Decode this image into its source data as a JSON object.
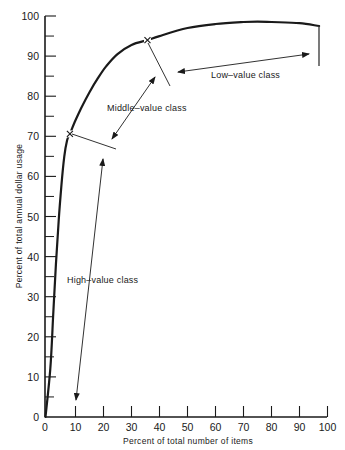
{
  "chart_data": {
    "type": "line",
    "title": "",
    "xlabel": "Percent of total number of items",
    "ylabel": "Percent of total annual dollar usage",
    "xlim": [
      0,
      100
    ],
    "ylim": [
      0,
      100
    ],
    "grid": false,
    "x_ticks": [
      0,
      10,
      20,
      30,
      40,
      50,
      60,
      70,
      80,
      90,
      100
    ],
    "y_ticks": [
      0,
      10,
      20,
      30,
      40,
      50,
      60,
      70,
      80,
      90,
      100
    ],
    "y_minor_ticks": [
      5,
      15,
      25,
      35,
      45,
      55,
      65,
      75,
      85,
      95
    ],
    "series": [
      {
        "name": "ABC cumulative curve",
        "x": [
          0,
          1,
          2,
          3,
          4,
          5,
          6,
          7,
          8,
          10,
          12,
          15,
          18,
          21,
          25,
          30,
          35.7,
          40,
          50,
          60,
          70,
          75,
          80,
          90,
          97
        ],
        "y": [
          0,
          12,
          25,
          38,
          49,
          58,
          65,
          69,
          70.6,
          74,
          77,
          81,
          84.5,
          87.5,
          90.5,
          92.8,
          94,
          95,
          97,
          98,
          98.5,
          98.6,
          98.5,
          98.2,
          97.5
        ]
      }
    ],
    "markers": [
      {
        "x": 8,
        "y": 70.6,
        "symbol": "x"
      },
      {
        "x": 35.7,
        "y": 94,
        "symbol": "x"
      }
    ],
    "annotations": [
      {
        "text": "High–value class",
        "range_x": [
          0,
          8
        ]
      },
      {
        "text": "Middle–value class",
        "range_x": [
          8,
          35.7
        ]
      },
      {
        "text": "Low–value class",
        "range_x": [
          35.7,
          97
        ]
      }
    ]
  },
  "labels": {
    "xlabel": "Percent of total number of items",
    "ylabel": "Percent of total annual dollar usage",
    "high": "High–value class",
    "middle": "Middle–value class",
    "low": "Low–value class",
    "x_ticks": [
      "0",
      "10",
      "20",
      "30",
      "40",
      "50",
      "60",
      "70",
      "80",
      "90",
      "100"
    ],
    "y_ticks": [
      "0",
      "10",
      "20",
      "30",
      "40",
      "50",
      "60",
      "70",
      "80",
      "90",
      "100"
    ]
  }
}
